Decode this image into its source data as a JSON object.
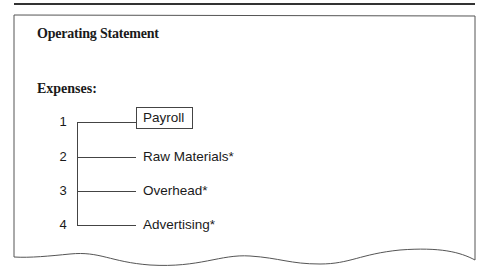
{
  "document": {
    "title": "Operating Statement",
    "section_label": "Expenses:",
    "items": [
      {
        "number": "1",
        "label": "Payroll",
        "highlighted": true
      },
      {
        "number": "2",
        "label": "Raw Materials*",
        "highlighted": false
      },
      {
        "number": "3",
        "label": "Overhead*",
        "highlighted": false
      },
      {
        "number": "4",
        "label": "Advertising*",
        "highlighted": false
      }
    ]
  },
  "colors": {
    "line": "#444444",
    "text": "#1a1a1a",
    "background": "#ffffff"
  }
}
